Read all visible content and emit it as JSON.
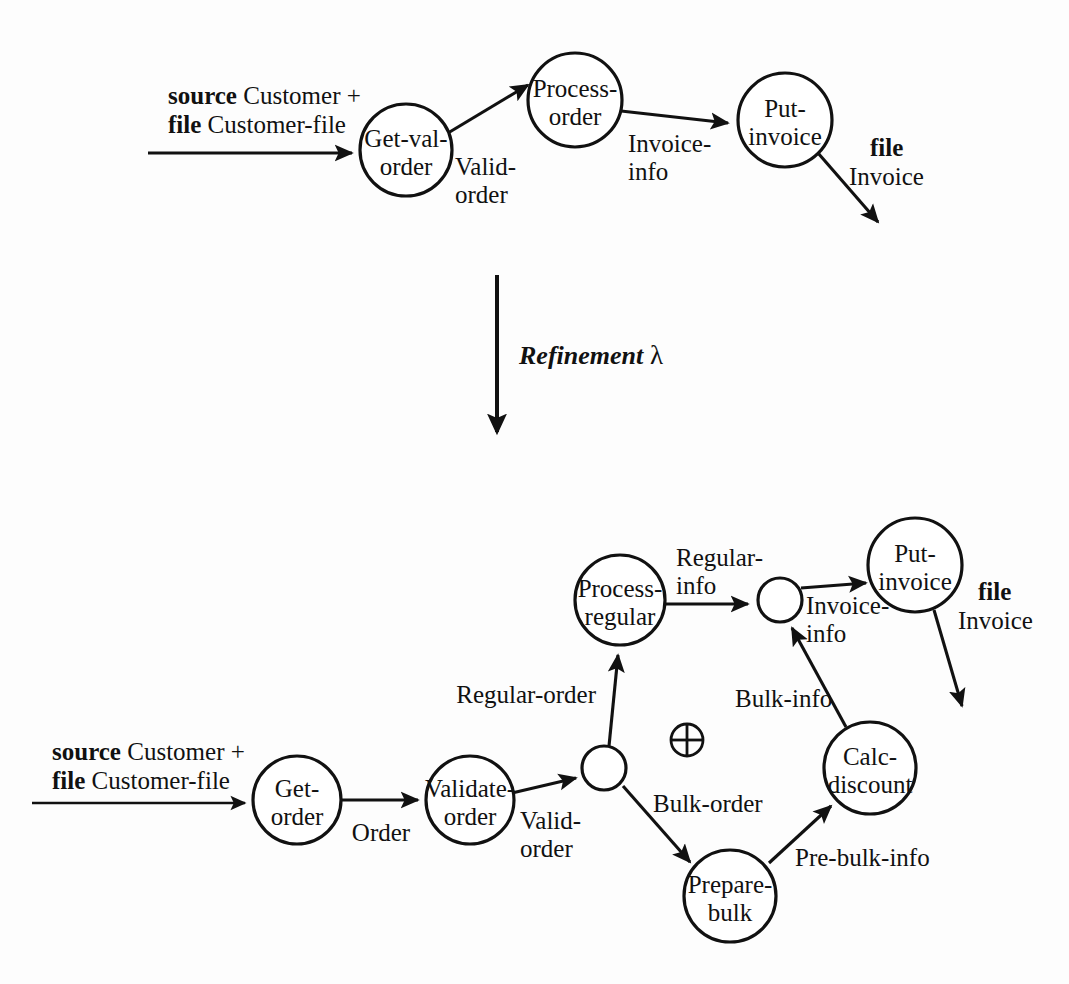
{
  "diagram": {
    "colors": {
      "ink": "#111111",
      "paper": "#fdfdfd",
      "node_fill": "#ffffff"
    },
    "refinement": {
      "label": "Refinement",
      "symbol": "λ"
    },
    "operator_symbol": "⊕",
    "abstract": {
      "input": {
        "keyword1": "source",
        "text1": " Customer +",
        "keyword2": "file",
        "text2": " Customer-file"
      },
      "output": {
        "keyword": "file",
        "text": "Invoice"
      },
      "nodes": [
        {
          "id": "get-val-order",
          "line1": "Get-val-",
          "line2": "order",
          "cx": 406,
          "cy": 150,
          "r": 46
        },
        {
          "id": "process-order",
          "line1": "Process-",
          "line2": "order",
          "cx": 575,
          "cy": 100,
          "r": 47
        },
        {
          "id": "put-invoice",
          "line1": "Put-",
          "line2": "invoice",
          "cx": 785,
          "cy": 120,
          "r": 47
        }
      ],
      "edges": [
        {
          "id": "valid-order",
          "line1": "Valid-",
          "line2": "order"
        },
        {
          "id": "invoice-info",
          "line1": "Invoice-",
          "line2": "info"
        }
      ]
    },
    "concrete": {
      "input": {
        "keyword1": "source",
        "text1": " Customer +",
        "keyword2": "file",
        "text2": " Customer-file"
      },
      "output": {
        "keyword": "file",
        "text": "Invoice"
      },
      "nodes": [
        {
          "id": "get-order",
          "line1": "Get-",
          "line2": "order",
          "cx": 297,
          "cy": 800,
          "r": 44
        },
        {
          "id": "validate-order",
          "line1": "Validate-",
          "line2": "order",
          "cx": 470,
          "cy": 800,
          "r": 44
        },
        {
          "id": "process-regular",
          "line1": "Process-",
          "line2": "regular",
          "cx": 620,
          "cy": 600,
          "r": 45
        },
        {
          "id": "prepare-bulk",
          "line1": "Prepare-",
          "line2": "bulk",
          "cx": 730,
          "cy": 896,
          "r": 46
        },
        {
          "id": "calc-discount",
          "line1": "Calc-",
          "line2": "discount",
          "cx": 870,
          "cy": 768,
          "r": 46
        },
        {
          "id": "put-invoice",
          "line1": "Put-",
          "line2": "invoice",
          "cx": 915,
          "cy": 565,
          "r": 47
        }
      ],
      "junctions": [
        {
          "id": "split-node",
          "cx": 604,
          "cy": 768,
          "r": 22
        },
        {
          "id": "merge-node",
          "cx": 780,
          "cy": 600,
          "r": 22
        }
      ],
      "edges": [
        {
          "id": "order",
          "label": "Order"
        },
        {
          "id": "valid-order",
          "line1": "Valid-",
          "line2": "order"
        },
        {
          "id": "regular-order",
          "label": "Regular-order"
        },
        {
          "id": "bulk-order",
          "label": "Bulk-order"
        },
        {
          "id": "regular-info",
          "line1": "Regular-",
          "line2": "info"
        },
        {
          "id": "bulk-info",
          "label": "Bulk-info"
        },
        {
          "id": "pre-bulk-info",
          "label": "Pre-bulk-info"
        },
        {
          "id": "invoice-info",
          "line1": "Invoice-",
          "line2": "info"
        }
      ]
    }
  }
}
